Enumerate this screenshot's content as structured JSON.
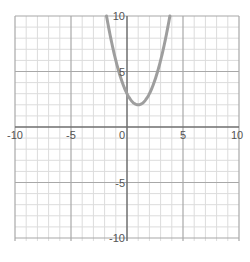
{
  "chart_data": {
    "type": "line",
    "title": "",
    "xlabel": "",
    "ylabel": "",
    "xlim": [
      -10,
      10
    ],
    "ylim": [
      -10,
      10
    ],
    "grid": true,
    "grid_step": 1,
    "x_ticks": [
      -10,
      -5,
      0,
      5,
      10
    ],
    "y_ticks": [
      -10,
      -5,
      5,
      10
    ],
    "x_tick_labels": [
      "-10",
      "-5",
      "0",
      "5",
      "10"
    ],
    "y_tick_labels": [
      "-10",
      "-5",
      "5",
      "10"
    ],
    "series": [
      {
        "name": "parabola",
        "equation": "y = (x - 1)^2 + 2",
        "vertex": [
          1,
          2
        ],
        "y_intercept": 3,
        "x_range": [
          -1.83,
          3.83
        ],
        "color": "#9e9e9e"
      }
    ]
  },
  "colors": {
    "grid_minor": "#dcdcdc",
    "grid_major": "#a8a8a8",
    "axis": "#6e6e6e",
    "curve": "#9e9e9e",
    "label": "#555555"
  }
}
